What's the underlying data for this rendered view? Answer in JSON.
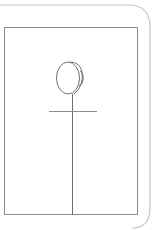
{
  "diagram": {
    "colors": {
      "background": "#ffffff",
      "outer_panel_stroke": "#c4c4c4",
      "frame_stroke": "#8c8c8c",
      "figure_stroke": "#6e6e6e"
    },
    "shapes": {
      "outer_panel": {
        "x": -20,
        "y": 5,
        "width": 170,
        "height": 223,
        "corner_radius": 22
      },
      "frame": {
        "x": 4,
        "y": 27,
        "width": 134,
        "height": 188
      },
      "oval": {
        "cx": 69,
        "cy": 78,
        "rx": 11.5,
        "ry": 16
      },
      "oval_rim": {
        "cx": 79,
        "cy": 78,
        "rx": 4,
        "ry": 8
      },
      "post": {
        "x": 72,
        "y1": 94,
        "y2": 215
      },
      "crossbar": {
        "y": 111,
        "x1": 49,
        "x2": 97
      }
    }
  }
}
